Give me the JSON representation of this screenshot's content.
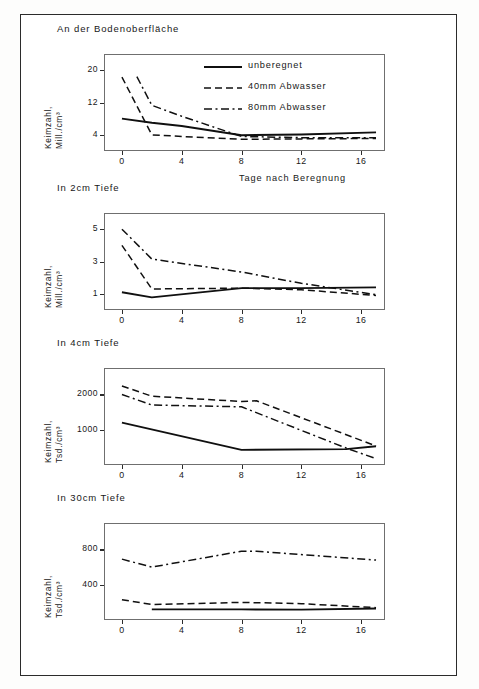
{
  "figure": {
    "xlabel": "Tage nach Beregnung",
    "legend": {
      "entries": [
        {
          "label": "unberegnet",
          "style": "solid"
        },
        {
          "label": "40mm Abwasser",
          "style": "dashed"
        },
        {
          "label": "80mm Abwasser",
          "style": "dashdot"
        }
      ]
    }
  },
  "chart_data": [
    {
      "type": "line",
      "title": "An der Bodenoberfläche",
      "xlabel": "Tage nach Beregnung",
      "ylabel": "Keimzahl, Mill./cm³",
      "ylabel_line1": "Keimzahl,",
      "ylabel_line2": "Mill./cm³",
      "xticks": [
        0,
        4,
        8,
        12,
        16
      ],
      "yticks": [
        4,
        12,
        20
      ],
      "xlim": [
        -1.2,
        17.6
      ],
      "ylim": [
        0,
        24
      ],
      "grid": false,
      "legend_position": "upper right",
      "series": [
        {
          "name": "unberegnet",
          "style": "solid",
          "x": [
            0,
            2,
            4,
            8,
            12,
            17
          ],
          "values": [
            8.0,
            7.0,
            6.2,
            3.9,
            4.1,
            4.6
          ]
        },
        {
          "name": "40mm Abwasser",
          "style": "dashed",
          "x": [
            0,
            2,
            4,
            8,
            12,
            17
          ],
          "values": [
            18.3,
            4.0,
            3.6,
            2.9,
            3.0,
            3.1
          ]
        },
        {
          "name": "80mm Abwasser",
          "style": "dashdot",
          "x": [
            1,
            2,
            4,
            8,
            12,
            17
          ],
          "values": [
            18.4,
            11.3,
            8.6,
            3.6,
            3.3,
            3.3
          ]
        }
      ]
    },
    {
      "type": "line",
      "title": "In 2cm Tiefe",
      "xlabel": "",
      "ylabel": "Keimzahl, Mill./cm³",
      "ylabel_line1": "Keimzahl,",
      "ylabel_line2": "Mill./cm³",
      "xticks": [
        0,
        4,
        8,
        12,
        16
      ],
      "yticks": [
        1,
        3,
        5
      ],
      "xlim": [
        -1.2,
        17.6
      ],
      "ylim": [
        0,
        6
      ],
      "grid": false,
      "legend_position": "none",
      "series": [
        {
          "name": "unberegnet",
          "style": "solid",
          "x": [
            0,
            2,
            8,
            12,
            17
          ],
          "values": [
            1.1,
            0.78,
            1.35,
            1.35,
            1.4
          ]
        },
        {
          "name": "40mm Abwasser",
          "style": "dashed",
          "x": [
            0,
            2,
            8,
            12,
            17
          ],
          "values": [
            4.0,
            1.3,
            1.35,
            1.25,
            0.9
          ]
        },
        {
          "name": "80mm Abwasser",
          "style": "dashdot",
          "x": [
            0,
            2,
            8,
            12,
            17
          ],
          "values": [
            5.0,
            3.15,
            2.35,
            1.65,
            0.95
          ]
        }
      ]
    },
    {
      "type": "line",
      "title": "In 4cm Tiefe",
      "xlabel": "",
      "ylabel": "Keimzahl, Tsd./cm³",
      "ylabel_line1": "Keimzahl,",
      "ylabel_line2": "Tsd./cm³",
      "xticks": [
        0,
        4,
        8,
        12,
        16
      ],
      "yticks": [
        1000,
        2000
      ],
      "xlim": [
        -1.2,
        17.6
      ],
      "ylim": [
        0,
        2750
      ],
      "grid": false,
      "legend_position": "none",
      "series": [
        {
          "name": "unberegnet",
          "style": "solid",
          "x": [
            0,
            8,
            15,
            17
          ],
          "values": [
            1200,
            430,
            450,
            530
          ]
        },
        {
          "name": "40mm Abwasser",
          "style": "dashed",
          "x": [
            0,
            2,
            8,
            9,
            17
          ],
          "values": [
            2240,
            1950,
            1800,
            1820,
            540
          ]
        },
        {
          "name": "80mm Abwasser",
          "style": "dashdot",
          "x": [
            0,
            2,
            8,
            15,
            17
          ],
          "values": [
            2000,
            1700,
            1650,
            480,
            180
          ]
        }
      ]
    },
    {
      "type": "line",
      "title": "In 30cm Tiefe",
      "xlabel": "",
      "ylabel": "Keimzahl, Tsd./cm³",
      "ylabel_line1": "Keimzahl,",
      "ylabel_line2": "Tsd./cm³",
      "xticks": [
        0,
        4,
        8,
        12,
        16
      ],
      "yticks": [
        400,
        800
      ],
      "xlim": [
        -1.2,
        17.6
      ],
      "ylim": [
        0,
        1100
      ],
      "grid": false,
      "legend_position": "none",
      "series": [
        {
          "name": "unberegnet",
          "style": "solid",
          "x": [
            2,
            8,
            12,
            17
          ],
          "values": [
            120,
            120,
            118,
            130
          ]
        },
        {
          "name": "40mm Abwasser",
          "style": "dashed",
          "x": [
            0,
            2,
            8,
            12,
            17
          ],
          "values": [
            230,
            175,
            200,
            185,
            140
          ]
        },
        {
          "name": "80mm Abwasser",
          "style": "dashdot",
          "x": [
            0,
            2,
            8,
            9,
            17
          ],
          "values": [
            690,
            600,
            780,
            780,
            680
          ]
        }
      ]
    }
  ]
}
